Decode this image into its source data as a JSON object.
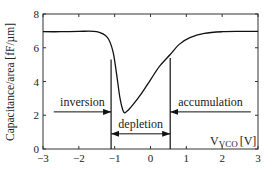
{
  "chart_data": {
    "type": "line",
    "title": "",
    "xlabel": "V_VCO [V]",
    "xlabel_main": "V",
    "xlabel_sub": "VCO",
    "xlabel_unit": "[V]",
    "ylabel": "Capacitance/area [fF/µm]",
    "xlim": [
      -3,
      3
    ],
    "ylim": [
      0,
      8
    ],
    "grid": false,
    "legend": null,
    "x_ticks": [
      "−3",
      "−2",
      "−1",
      "0",
      "1",
      "2",
      "3"
    ],
    "y_ticks": [
      "0",
      "2",
      "4",
      "6",
      "8"
    ],
    "series": [
      {
        "name": "C-V curve",
        "x": [
          -3.0,
          -2.5,
          -2.0,
          -1.5,
          -1.2,
          -1.05,
          -0.95,
          -0.85,
          -0.75,
          -0.65,
          -0.5,
          -0.25,
          0.0,
          0.25,
          0.55,
          0.8,
          1.1,
          1.5,
          2.0,
          2.5,
          3.0
        ],
        "y": [
          6.95,
          6.95,
          6.97,
          6.95,
          6.6,
          5.8,
          4.5,
          3.0,
          2.2,
          2.25,
          2.6,
          3.3,
          4.1,
          4.9,
          5.6,
          6.2,
          6.6,
          6.85,
          6.95,
          6.97,
          6.97
        ]
      }
    ],
    "annotations": [
      {
        "text": "inversion",
        "arrow": "right",
        "x_range": [
          -2.7,
          -1.1
        ],
        "y": 2.2
      },
      {
        "text": "depletion",
        "arrow": "both",
        "x_range": [
          -1.1,
          0.55
        ],
        "y": 0.9
      },
      {
        "text": "accumulation",
        "arrow": "left",
        "x_range": [
          0.55,
          2.8
        ],
        "y": 2.2
      }
    ],
    "vertical_markers": [
      {
        "x": -1.1,
        "y_range": [
          0,
          5.3
        ]
      },
      {
        "x": 0.55,
        "y_range": [
          0,
          5.4
        ]
      }
    ]
  }
}
